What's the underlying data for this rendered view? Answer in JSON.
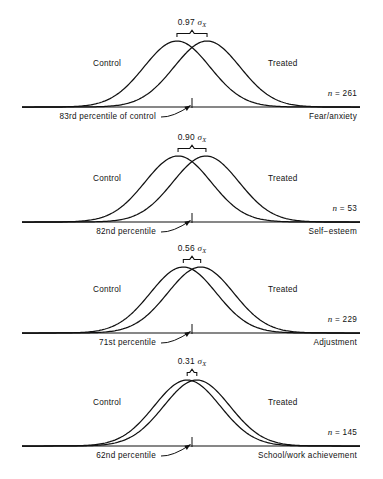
{
  "figure": {
    "type": "multi-panel-distribution-overlap",
    "panel_count": 4,
    "axis_color": "#111111"
  },
  "panels": [
    {
      "id": "fear-anxiety",
      "effect_size": "0.97",
      "sigma_label": "σ",
      "sigma_subscript": "X",
      "control_label": "Control",
      "treated_label": "Treated",
      "n_label": "n",
      "n_equals": "=",
      "n_value": "261",
      "percentile_label": "83rd percentile of control",
      "outcome_label": "Fear/anxiety"
    },
    {
      "id": "self-esteem",
      "effect_size": "0.90",
      "sigma_label": "σ",
      "sigma_subscript": "X",
      "control_label": "Control",
      "treated_label": "Treated",
      "n_label": "n",
      "n_equals": "=",
      "n_value": "53",
      "percentile_label": "82nd percentile",
      "outcome_label": "Self−esteem"
    },
    {
      "id": "adjustment",
      "effect_size": "0.56",
      "sigma_label": "σ",
      "sigma_subscript": "X",
      "control_label": "Control",
      "treated_label": "Treated",
      "n_label": "n",
      "n_equals": "=",
      "n_value": "229",
      "percentile_label": "71st percentile",
      "outcome_label": "Adjustment"
    },
    {
      "id": "school-work-achievement",
      "effect_size": "0.31",
      "sigma_label": "σ",
      "sigma_subscript": "X",
      "control_label": "Control",
      "treated_label": "Treated",
      "n_label": "n",
      "n_equals": "=",
      "n_value": "145",
      "percentile_label": "62nd percentile",
      "outcome_label": "School/work achievement"
    }
  ],
  "chart_data": {
    "type": "line",
    "title": "",
    "xlabel": "",
    "ylabel": "",
    "grid": false,
    "legend": "inline-annotations",
    "series": [
      {
        "name": "Fear/anxiety",
        "effect_size_sd": 0.97,
        "n": 261,
        "control_percentile_equivalent": 83,
        "curves": [
          {
            "name": "Control",
            "mean": 0.0,
            "sd": 1.0
          },
          {
            "name": "Treated",
            "mean": 0.97,
            "sd": 1.0
          }
        ]
      },
      {
        "name": "Self-esteem",
        "effect_size_sd": 0.9,
        "n": 53,
        "control_percentile_equivalent": 82,
        "curves": [
          {
            "name": "Control",
            "mean": 0.0,
            "sd": 1.0
          },
          {
            "name": "Treated",
            "mean": 0.9,
            "sd": 1.0
          }
        ]
      },
      {
        "name": "Adjustment",
        "effect_size_sd": 0.56,
        "n": 229,
        "control_percentile_equivalent": 71,
        "curves": [
          {
            "name": "Control",
            "mean": 0.0,
            "sd": 1.0
          },
          {
            "name": "Treated",
            "mean": 0.56,
            "sd": 1.0
          }
        ]
      },
      {
        "name": "School/work achievement",
        "effect_size_sd": 0.31,
        "n": 145,
        "control_percentile_equivalent": 62,
        "curves": [
          {
            "name": "Control",
            "mean": 0.0,
            "sd": 1.0
          },
          {
            "name": "Treated",
            "mean": 0.31,
            "sd": 1.0
          }
        ]
      }
    ],
    "categories": [
      "Fear/anxiety",
      "Self-esteem",
      "Adjustment",
      "School/work achievement"
    ],
    "values": [
      0.97,
      0.9,
      0.56,
      0.31
    ]
  }
}
